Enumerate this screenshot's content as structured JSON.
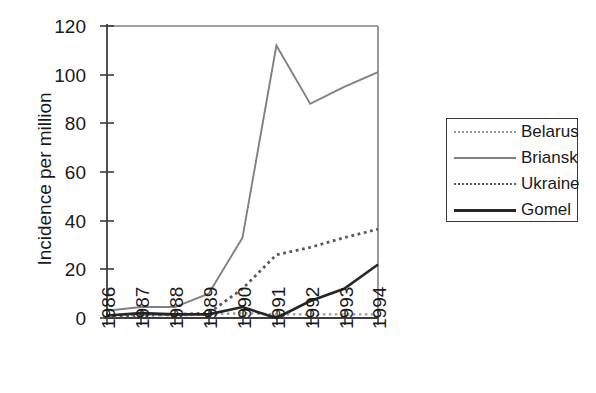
{
  "chart_data": {
    "type": "line",
    "title": "",
    "xlabel": "",
    "ylabel": "Incidence per million",
    "categories": [
      "1986",
      "1987",
      "1988",
      "1989",
      "1990",
      "1991",
      "1992",
      "1993",
      "1994"
    ],
    "x": [
      1986,
      1987,
      1988,
      1989,
      1990,
      1991,
      1992,
      1993,
      1994
    ],
    "ylim": [
      0,
      120
    ],
    "yticks": [
      0,
      20,
      40,
      60,
      80,
      100,
      120
    ],
    "grid": false,
    "legend_position": "right",
    "series": [
      {
        "name": "Belarus",
        "style": "dotted",
        "color": "#9a9a9a",
        "values": [
          1,
          1.5,
          1,
          1.5,
          2,
          1.5,
          1.5,
          1.5,
          1.5
        ]
      },
      {
        "name": "Briansk",
        "style": "solid",
        "color": "#808080",
        "values": [
          3,
          4.5,
          4.5,
          10,
          33,
          112,
          88,
          95,
          101
        ]
      },
      {
        "name": "Ukraine",
        "style": "dotted",
        "color": "#5a5a5a",
        "values": [
          0.5,
          1,
          1.5,
          2,
          12,
          26,
          29,
          33,
          36.5
        ]
      },
      {
        "name": "Gomel",
        "style": "solid",
        "color": "#262626",
        "values": [
          1,
          2,
          1.5,
          1.5,
          4.5,
          0,
          7,
          12,
          22
        ]
      }
    ]
  },
  "axis": {
    "y_title": "Incidence per million",
    "y_tick_labels": [
      "120",
      "100",
      "80",
      "60",
      "40",
      "20",
      "0"
    ],
    "x_tick_labels": [
      "1986",
      "1987",
      "1988",
      "1989",
      "1990",
      "1991",
      "1992",
      "1993",
      "1994"
    ]
  },
  "legend": {
    "items": [
      {
        "label": "Belarus",
        "key": "belarus-line-key"
      },
      {
        "label": "Briansk",
        "key": "briansk-line-key"
      },
      {
        "label": "Ukraine",
        "key": "ukraine-line-key"
      },
      {
        "label": "Gomel",
        "key": "gomel-line-key"
      }
    ]
  },
  "colors": {
    "belarus": "#9a9a9a",
    "briansk": "#808080",
    "ukraine": "#5a5a5a",
    "gomel": "#262626",
    "axis": "#3c3c3c",
    "text": "#1a1a1a"
  }
}
